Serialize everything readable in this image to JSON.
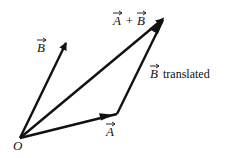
{
  "diagram": {
    "origin_label": "O",
    "vectors": [
      {
        "name": "A",
        "label": "A",
        "from": [
          20,
          138
        ],
        "to": [
          117,
          114
        ]
      },
      {
        "name": "B",
        "label": "B",
        "from": [
          20,
          138
        ],
        "to": [
          66,
          42
        ]
      },
      {
        "name": "A+B",
        "label": "A + B",
        "from": [
          20,
          138
        ],
        "to": [
          164,
          18
        ]
      },
      {
        "name": "B translated",
        "label": "B",
        "suffix": "translated",
        "from": [
          117,
          114
        ],
        "to": [
          164,
          18
        ]
      }
    ],
    "labels": {
      "origin": "O",
      "a": "A",
      "b": "B",
      "sum_a": "A",
      "sum_plus": "+",
      "sum_b": "B",
      "b_translated_b": "B",
      "b_translated_text": "translated"
    },
    "colors": {
      "stroke": "#111111",
      "background": "#ffffff"
    }
  }
}
